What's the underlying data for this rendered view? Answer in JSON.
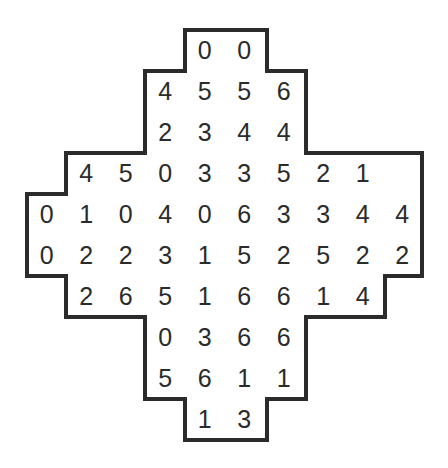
{
  "figure": {
    "type": "number-grid-puzzle",
    "shape_name": "stepped-diamond",
    "background_color": "#ffffff",
    "border_color": "#2b2b2b",
    "digit_color": "#2b2b2b",
    "border_width": 4,
    "grid": {
      "columns": 10,
      "rows": 10,
      "origin_x": 27,
      "origin_y": 30,
      "cell_width": 39.5,
      "cell_height": 41
    }
  },
  "chart_data": {
    "type": "table",
    "title": "",
    "xlabel": "",
    "ylabel": "",
    "rows": [
      {
        "row_index": 0,
        "start_col": 4,
        "values": [
          "0",
          "0"
        ]
      },
      {
        "row_index": 1,
        "start_col": 3,
        "values": [
          "4",
          "5",
          "5",
          "6"
        ]
      },
      {
        "row_index": 2,
        "start_col": 3,
        "values": [
          "2",
          "3",
          "4",
          "4"
        ]
      },
      {
        "row_index": 3,
        "start_col": 1,
        "values": [
          "4",
          "5",
          "0",
          "3",
          "3",
          "5",
          "2",
          "1"
        ]
      },
      {
        "row_index": 4,
        "start_col": 0,
        "values": [
          "0",
          "1",
          "0",
          "4",
          "0",
          "6",
          "3",
          "3",
          "4",
          "4"
        ]
      },
      {
        "row_index": 5,
        "start_col": 0,
        "values": [
          "0",
          "2",
          "2",
          "3",
          "1",
          "5",
          "2",
          "5",
          "2",
          "2"
        ]
      },
      {
        "row_index": 6,
        "start_col": 1,
        "values": [
          "2",
          "6",
          "5",
          "1",
          "6",
          "6",
          "1",
          "4"
        ]
      },
      {
        "row_index": 7,
        "start_col": 3,
        "values": [
          "0",
          "3",
          "6",
          "6"
        ]
      },
      {
        "row_index": 8,
        "start_col": 3,
        "values": [
          "5",
          "6",
          "1",
          "1"
        ]
      },
      {
        "row_index": 9,
        "start_col": 4,
        "values": [
          "1",
          "3"
        ]
      }
    ],
    "outline_path": "M 185,30 L 267,30 L 267,71 L 306,71 L 306,153 L 422,153 L 422,194 L 422,276 L 385,276 L 385,317 L 306,317 L 306,399 L 267,399 L 267,440 L 185,440 L 185,399 L 145,399 L 145,317 L 66,317 L 66,276 L 27,276 L 27,194 L 66,194 L 66,153 L 145,153 L 145,71 L 185,71 Z"
  }
}
